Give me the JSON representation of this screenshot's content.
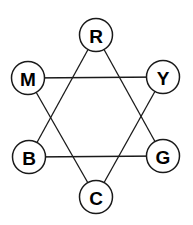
{
  "diagram": {
    "type": "color-hexagram",
    "colors": {
      "line": "#1a1a1a",
      "node_fill": "#ffffff",
      "text": "#000000"
    },
    "nodes": [
      {
        "id": "R",
        "label": "R",
        "x": 96,
        "y": 35
      },
      {
        "id": "Y",
        "label": "Y",
        "x": 163,
        "y": 77
      },
      {
        "id": "G",
        "label": "G",
        "x": 163,
        "y": 156
      },
      {
        "id": "C",
        "label": "C",
        "x": 96,
        "y": 197
      },
      {
        "id": "B",
        "label": "B",
        "x": 29,
        "y": 157
      },
      {
        "id": "M",
        "label": "M",
        "x": 28,
        "y": 78
      }
    ],
    "node_radius": 16.5,
    "edges": [
      {
        "from": "R",
        "to": "B"
      },
      {
        "from": "R",
        "to": "G"
      },
      {
        "from": "B",
        "to": "G"
      },
      {
        "from": "M",
        "to": "Y"
      },
      {
        "from": "M",
        "to": "C"
      },
      {
        "from": "Y",
        "to": "C"
      }
    ]
  }
}
